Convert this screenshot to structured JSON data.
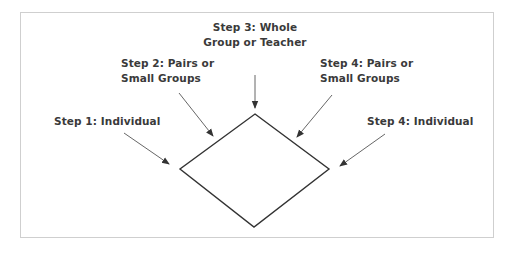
{
  "diagram": {
    "type": "think-pair-share flow",
    "shape": "diamond",
    "colors": {
      "text": "#3a3a3a",
      "diamond_stroke": "#333333",
      "arrow_stroke": "#555555",
      "frame_border": "#cfcfcf",
      "background": "#ffffff"
    },
    "steps": [
      {
        "id": "step1",
        "lines": [
          "Step 1: Individual"
        ]
      },
      {
        "id": "step2",
        "lines": [
          "Step 2: Pairs or",
          "Small Groups"
        ]
      },
      {
        "id": "step3",
        "lines": [
          "Step 3: Whole",
          "Group or Teacher"
        ]
      },
      {
        "id": "step4a",
        "lines": [
          "Step 4: Pairs or",
          "Small Groups"
        ]
      },
      {
        "id": "step4b",
        "lines": [
          "Step 4: Individual"
        ]
      }
    ]
  }
}
